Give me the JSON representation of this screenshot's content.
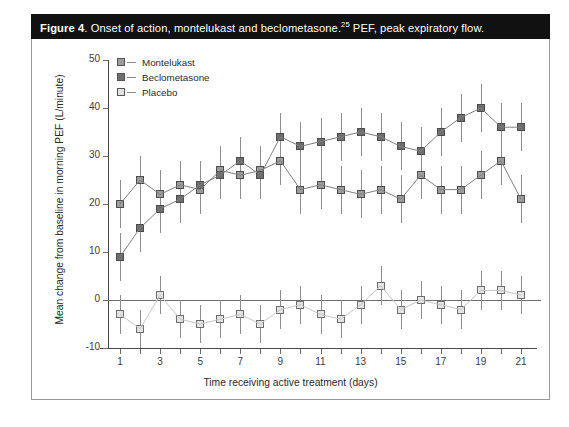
{
  "figure": {
    "number_label": "Figure 4",
    "caption_main": ". Onset of action, montelukast and beclometasone.",
    "caption_ref": "25",
    "caption_tail": " PEF, peak expiratory flow."
  },
  "legend": {
    "position": "top-left-inside",
    "items": [
      {
        "label": "Montelukast",
        "color": "#9c9c9c"
      },
      {
        "label": "Beclometasone",
        "color": "#6e6e6e"
      },
      {
        "label": "Placebo",
        "color": "#e3e3e3"
      }
    ]
  },
  "chart_data": {
    "type": "line",
    "title": "Onset of action, montelukast and beclometasone",
    "xlabel": "Time receiving active treatment (days)",
    "ylabel": "Mean change from baseline in morning PEF (L/minute)",
    "xlim": [
      0.4,
      21.6
    ],
    "ylim": [
      -10,
      50
    ],
    "yticks": [
      -10,
      0,
      10,
      20,
      30,
      40,
      50
    ],
    "ytick_labels": [
      "-10",
      "0",
      "10",
      "20",
      "30",
      "40",
      "50"
    ],
    "xticks": [
      1,
      2,
      3,
      4,
      5,
      6,
      7,
      8,
      9,
      10,
      11,
      12,
      13,
      14,
      15,
      16,
      17,
      18,
      19,
      20,
      21
    ],
    "xtick_labels_shown": [
      "1",
      "",
      "3",
      "",
      "5",
      "",
      "7",
      "",
      "9",
      "",
      "11",
      "",
      "13",
      "",
      "15",
      "",
      "17",
      "",
      "19",
      "",
      "21"
    ],
    "grid": false,
    "zero_line": true,
    "x": [
      1,
      2,
      3,
      4,
      5,
      6,
      7,
      8,
      9,
      10,
      11,
      12,
      13,
      14,
      15,
      16,
      17,
      18,
      19,
      20,
      21
    ],
    "series": [
      {
        "name": "Montelukast",
        "color": "#9c9c9c",
        "values": [
          20,
          25,
          22,
          24,
          23,
          27,
          26,
          27,
          29,
          23,
          24,
          23,
          22,
          23,
          21,
          26,
          23,
          23,
          26,
          29,
          21
        ],
        "err_low": [
          5,
          5,
          5,
          5,
          5,
          5,
          5,
          5,
          5,
          5,
          5,
          5,
          5,
          5,
          5,
          5,
          5,
          5,
          5,
          5,
          5
        ],
        "err_high": [
          5,
          5,
          5,
          5,
          5,
          5,
          5,
          5,
          5,
          5,
          5,
          5,
          5,
          5,
          5,
          5,
          5,
          5,
          5,
          5,
          5
        ]
      },
      {
        "name": "Beclometasone",
        "color": "#6e6e6e",
        "values": [
          9,
          15,
          19,
          21,
          24,
          26,
          29,
          26,
          34,
          32,
          33,
          34,
          35,
          34,
          32,
          31,
          35,
          38,
          40,
          36,
          36
        ],
        "err_low": [
          5,
          5,
          5,
          5,
          5,
          5,
          5,
          5,
          5,
          5,
          5,
          5,
          5,
          5,
          5,
          5,
          5,
          5,
          5,
          5,
          5
        ],
        "err_high": [
          5,
          5,
          5,
          5,
          5,
          5,
          5,
          5,
          5,
          5,
          5,
          5,
          5,
          5,
          5,
          5,
          5,
          5,
          5,
          5,
          5
        ]
      },
      {
        "name": "Placebo",
        "color": "#e3e3e3",
        "values": [
          -3,
          -6,
          1,
          -4,
          -5,
          -4,
          -3,
          -5,
          -2,
          -1,
          -3,
          -4,
          -1,
          3,
          -2,
          0,
          -1,
          -2,
          2,
          2,
          1
        ],
        "err_low": [
          4,
          4,
          4,
          4,
          4,
          4,
          4,
          4,
          4,
          4,
          4,
          4,
          4,
          4,
          4,
          4,
          4,
          4,
          4,
          4,
          4
        ],
        "err_high": [
          4,
          4,
          4,
          4,
          4,
          4,
          4,
          4,
          4,
          4,
          4,
          4,
          4,
          4,
          4,
          4,
          4,
          4,
          4,
          4,
          4
        ]
      }
    ]
  }
}
